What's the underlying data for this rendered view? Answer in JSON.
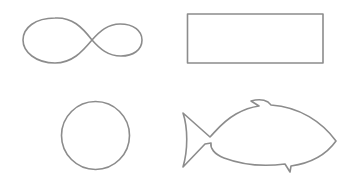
{
  "canvas": {
    "width": 354,
    "height": 185,
    "background": "#ffffff",
    "stroke_color": "#8c8c8c"
  },
  "shapes": [
    {
      "id": "infinity",
      "label": "infinity-shape",
      "position": "top-left"
    },
    {
      "id": "rectangle",
      "label": "rectangle-shape",
      "position": "top-right"
    },
    {
      "id": "circle",
      "label": "circle-shape",
      "position": "bottom-left"
    },
    {
      "id": "fish",
      "label": "fish-shape",
      "position": "bottom-right"
    }
  ]
}
